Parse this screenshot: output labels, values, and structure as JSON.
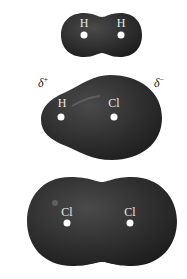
{
  "figure": {
    "colors": {
      "surface": "#2e2e2e",
      "highlight": "#5a5a5a",
      "nucleus": "#ffffff",
      "background": "#ffffff"
    },
    "molecules": [
      {
        "name": "H2",
        "atoms": [
          {
            "label": "H"
          },
          {
            "label": "H"
          }
        ]
      },
      {
        "name": "HCl",
        "atoms": [
          {
            "label": "H"
          },
          {
            "label": "Cl"
          }
        ],
        "partial_charges": {
          "left": {
            "symbol": "δ",
            "sign": "+"
          },
          "right": {
            "symbol": "δ",
            "sign": "−"
          }
        }
      },
      {
        "name": "Cl2",
        "atoms": [
          {
            "label": "Cl"
          },
          {
            "label": "Cl"
          }
        ]
      }
    ]
  }
}
